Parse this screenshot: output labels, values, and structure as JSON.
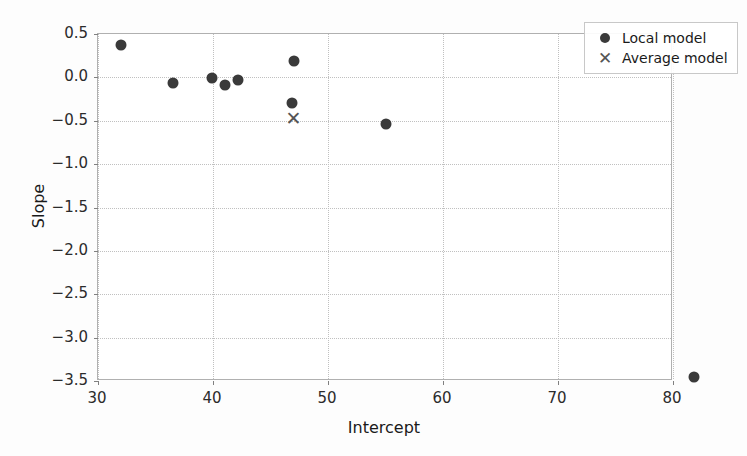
{
  "chart_data": {
    "type": "scatter",
    "title": "",
    "xlabel": "Intercept",
    "ylabel": "Slope",
    "xlim": [
      30,
      80
    ],
    "ylim": [
      -3.5,
      0.5
    ],
    "xticks": [
      30,
      40,
      50,
      60,
      70,
      80
    ],
    "xticklabels": [
      "30",
      "40",
      "50",
      "60",
      "70",
      "80"
    ],
    "yticks": [
      0.5,
      0.0,
      -0.5,
      -1.0,
      -1.5,
      -2.0,
      -2.5,
      -3.0,
      -3.5
    ],
    "yticklabels": [
      "0.5",
      "0.0",
      "−0.5",
      "−1.0",
      "−1.5",
      "−2.0",
      "−2.5",
      "−3.0",
      "−3.5"
    ],
    "grid": true,
    "grid_style": "dotted",
    "legend_position": "upper right",
    "series": [
      {
        "name": "Local model",
        "marker": "circle",
        "color": "#3a3a3a",
        "points": [
          {
            "x": 32.0,
            "y": 0.37
          },
          {
            "x": 36.5,
            "y": -0.06
          },
          {
            "x": 39.9,
            "y": -0.01
          },
          {
            "x": 41.0,
            "y": -0.09
          },
          {
            "x": 42.2,
            "y": -0.03
          },
          {
            "x": 47.0,
            "y": 0.19
          },
          {
            "x": 46.9,
            "y": -0.3
          },
          {
            "x": 55.0,
            "y": -0.54
          },
          {
            "x": 81.8,
            "y": -3.45
          }
        ]
      },
      {
        "name": "Average model",
        "marker": "x",
        "color": "#555555",
        "points": [
          {
            "x": 47.0,
            "y": -0.47
          }
        ]
      }
    ]
  },
  "legend": {
    "entries": [
      {
        "label": "Local model",
        "marker": "circle-icon"
      },
      {
        "label": "Average model",
        "marker": "cross-icon"
      }
    ]
  }
}
